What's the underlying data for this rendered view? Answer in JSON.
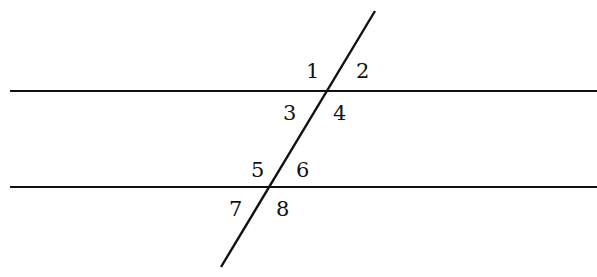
{
  "diagram": {
    "line_color": "#111111",
    "lines": {
      "parallel_top": {
        "x1": 10,
        "y1": 91,
        "x2": 597,
        "y2": 91
      },
      "parallel_bottom": {
        "x1": 10,
        "y1": 187,
        "x2": 597,
        "y2": 187
      },
      "transversal": {
        "x1": 375,
        "y1": 11,
        "x2": 221,
        "y2": 267
      }
    },
    "angles": [
      {
        "label": "1",
        "x": 306,
        "y": 78
      },
      {
        "label": "2",
        "x": 356,
        "y": 78
      },
      {
        "label": "3",
        "x": 283,
        "y": 120
      },
      {
        "label": "4",
        "x": 333,
        "y": 120
      },
      {
        "label": "5",
        "x": 251,
        "y": 177
      },
      {
        "label": "6",
        "x": 296,
        "y": 177
      },
      {
        "label": "7",
        "x": 229,
        "y": 216
      },
      {
        "label": "8",
        "x": 276,
        "y": 216
      }
    ]
  }
}
